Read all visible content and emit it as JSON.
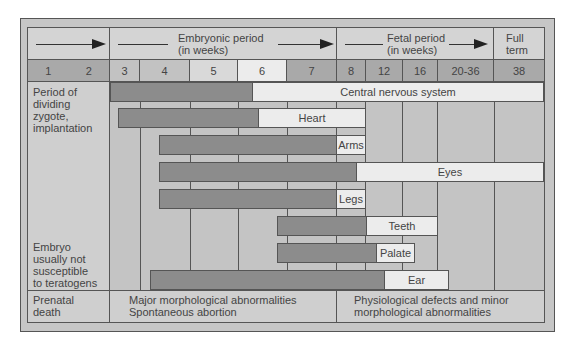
{
  "header": {
    "embryonic_label_line1": "Embryonic period",
    "embryonic_label_line2": "(in weeks)",
    "fetal_label_line1": "Fetal period",
    "fetal_label_line2": "(in weeks)",
    "full_term_line1": "Full",
    "full_term_line2": "term"
  },
  "weeks": {
    "w1": "1",
    "w2": "2",
    "w3": "3",
    "w4": "4",
    "w5": "5",
    "w6": "6",
    "w7": "7",
    "w8": "8",
    "w12": "12",
    "w16": "16",
    "w20_36": "20-36",
    "w38": "38"
  },
  "left_column": {
    "top_label": [
      "Period of",
      "dividing",
      "zygote,",
      "implantation"
    ],
    "bottom_label": [
      "Embryo",
      "usually not",
      "susceptible",
      "to teratogens"
    ],
    "footer_label": [
      "Prenatal",
      "death"
    ]
  },
  "bars": [
    {
      "label": "Central nervous system",
      "start_week": "3",
      "sensitive_until": "6",
      "ends": "38"
    },
    {
      "label": "Heart",
      "start_week": "3",
      "sensitive_until": "6",
      "ends": "8"
    },
    {
      "label": "Arms",
      "start_week": "4",
      "sensitive_until": "7",
      "ends": "8"
    },
    {
      "label": "Eyes",
      "start_week": "4",
      "sensitive_until": "8",
      "ends": "38"
    },
    {
      "label": "Legs",
      "start_week": "4",
      "sensitive_until": "7",
      "ends": "8"
    },
    {
      "label": "Teeth",
      "start_week": "6",
      "sensitive_until": "8",
      "ends": "16"
    },
    {
      "label": "Palate",
      "start_week": "6",
      "sensitive_until": "8",
      "ends": "12"
    },
    {
      "label": "Ear",
      "start_week": "3",
      "sensitive_until": "8",
      "ends": "16"
    }
  ],
  "footer": {
    "embryonic_effects_line1": "Major morphological abnormalities",
    "embryonic_effects_line2": "Spontaneous abortion",
    "fetal_effects_line1": "Physiological defects and minor",
    "fetal_effects_line2": "morphological abnormalities"
  },
  "colors": {
    "frame": "#c6c6c6",
    "header": "#d4d4d4",
    "sensitive_period": "#8c8c8c",
    "less_sensitive_period": "#ececec",
    "week_row": "#a9a9a9",
    "grid_lines": "#555555"
  }
}
